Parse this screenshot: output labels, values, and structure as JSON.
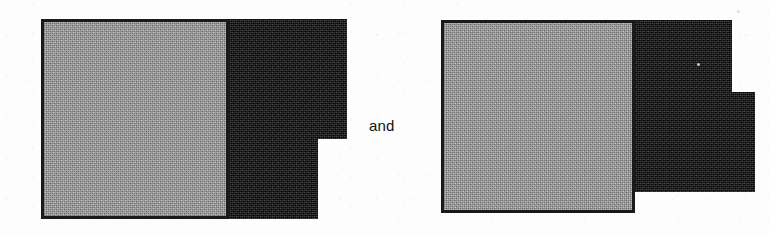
{
  "page": {
    "kind": "scanned-figure-pair",
    "width": 769,
    "height": 235,
    "background_color": "#fdfdfd"
  },
  "conjunction": {
    "text": "and",
    "x": 369,
    "y": 118,
    "color": "#131313"
  },
  "palette": {
    "paper": "#fdfdfd",
    "grey_fill": "#9d9d9d",
    "black_fill": "#131313",
    "outline": "#1a1a1a"
  },
  "figures": [
    {
      "id": "figure-left",
      "label": "left-shape",
      "description": "grey square with black L-shaped block attached on the right, notched at the lower right",
      "bounds": {
        "x": 41,
        "y": 19,
        "width": 307,
        "height": 200
      },
      "grey_region": {
        "x": 41,
        "y": 19,
        "width": 185,
        "height": 200
      },
      "black_regions": [
        {
          "x": 226,
          "y": 19,
          "width": 121,
          "height": 120
        },
        {
          "x": 226,
          "y": 139,
          "width": 92,
          "height": 80
        }
      ],
      "notch": {
        "corner": "bottom-right",
        "direction": "inward",
        "step_x": 318,
        "step_y": 139
      }
    },
    {
      "id": "figure-right",
      "label": "right-shape",
      "description": "grey square with black block on the right that steps outward and downward, its lower edge ending above the grey square",
      "bounds": {
        "x": 441,
        "y": 20,
        "width": 315,
        "height": 193
      },
      "grey_region": {
        "x": 441,
        "y": 20,
        "width": 191,
        "height": 193
      },
      "black_regions": [
        {
          "x": 632,
          "y": 20,
          "width": 100,
          "height": 72
        },
        {
          "x": 632,
          "y": 92,
          "width": 123,
          "height": 100
        }
      ],
      "notch": {
        "corner": "right",
        "direction": "outward",
        "step_x": 732,
        "step_y": 92
      }
    }
  ],
  "specks": [
    {
      "x": 697,
      "y": 63,
      "size": 3
    },
    {
      "x": 737,
      "y": 10,
      "size": 3
    }
  ]
}
